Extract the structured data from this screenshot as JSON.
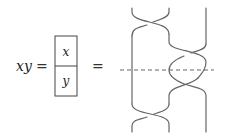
{
  "equation": {
    "lhs": "xy",
    "equals_1": "=",
    "equals_2": "=",
    "box": {
      "top_label": "x",
      "bottom_label": "y"
    }
  },
  "braid_diagram": {
    "strands": 3,
    "crossings": [
      {
        "strands": [
          1,
          2
        ],
        "position": "top"
      },
      {
        "strands": [
          2,
          3
        ],
        "position": "upper-middle"
      },
      {
        "strands": [
          2,
          3
        ],
        "position": "lower-middle"
      },
      {
        "strands": [
          1,
          2
        ],
        "position": "bottom"
      }
    ],
    "dashed_line": "horizontal cut between middle crossings"
  },
  "colors": {
    "strand": "#666666",
    "box_border": "#444444",
    "text": "#222222"
  }
}
